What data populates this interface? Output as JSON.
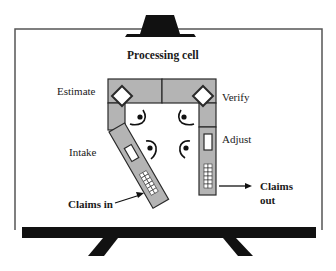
{
  "diagram": {
    "title": "Processing cell",
    "stations": [
      {
        "label": "Estimate"
      },
      {
        "label": "Verify"
      },
      {
        "label": "Intake"
      },
      {
        "label": "Adjust"
      }
    ],
    "flows": {
      "input_label": "Claims in",
      "output_label_line1": "Claims",
      "output_label_line2": "out"
    },
    "colors": {
      "workstation_fill": "#b4b4b4",
      "outline": "#2a2a2a",
      "board_border": "#555555",
      "stand": "#111111"
    }
  }
}
